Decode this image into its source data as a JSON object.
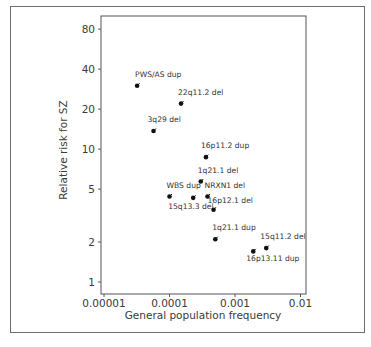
{
  "chart_data": {
    "type": "scatter",
    "title": "",
    "xlabel": "General population frequency",
    "ylabel": "Relative risk for SZ",
    "x_scale": "log",
    "y_scale": "log",
    "xlim": [
      1e-05,
      0.01
    ],
    "ylim": [
      0.9,
      100
    ],
    "x_ticks": [
      {
        "value": 1e-05,
        "label": "0.00001"
      },
      {
        "value": 0.0001,
        "label": "0.0001"
      },
      {
        "value": 0.001,
        "label": "0.001"
      },
      {
        "value": 0.01,
        "label": "0.01"
      }
    ],
    "y_ticks": [
      {
        "value": 1,
        "label": "1"
      },
      {
        "value": 2,
        "label": "2"
      },
      {
        "value": 5,
        "label": "5"
      },
      {
        "value": 10,
        "label": "10"
      },
      {
        "value": 20,
        "label": "20"
      },
      {
        "value": 40,
        "label": "40"
      },
      {
        "value": 80,
        "label": "80"
      }
    ],
    "grid": false,
    "legend": null,
    "points": [
      {
        "label": "PWS/AS dup",
        "x": 3.2e-05,
        "y": 30,
        "label_dx": -2,
        "label_dy": -9
      },
      {
        "label": "22q11.2 del",
        "x": 0.00015,
        "y": 22,
        "label_dx": -3,
        "label_dy": -9
      },
      {
        "label": "3q29 del",
        "x": 5.7e-05,
        "y": 13.7,
        "label_dx": -6,
        "label_dy": -9
      },
      {
        "label": "16p11.2 dup",
        "x": 0.00036,
        "y": 8.7,
        "label_dx": -5,
        "label_dy": -9
      },
      {
        "label": "1q21.1 del",
        "x": 0.0003,
        "y": 5.7,
        "label_dx": -3,
        "label_dy": -9
      },
      {
        "label": "WBS dup",
        "x": 0.0001,
        "y": 4.4,
        "label_dx": -3,
        "label_dy": -8
      },
      {
        "label": "15q13.3 del",
        "x": 0.00023,
        "y": 4.3,
        "label_dx": -25,
        "label_dy": 11
      },
      {
        "label": "NRXN1 del",
        "x": 0.00038,
        "y": 4.4,
        "label_dx": -3,
        "label_dy": -8
      },
      {
        "label": "16p12.1 del",
        "x": 0.00047,
        "y": 3.5,
        "label_dx": -6,
        "label_dy": -7
      },
      {
        "label": "1q21.1 dup",
        "x": 0.0005,
        "y": 2.1,
        "label_dx": -3,
        "label_dy": -9
      },
      {
        "label": "16p13.11 dup",
        "x": 0.0019,
        "y": 1.7,
        "label_dx": -7,
        "label_dy": 10
      },
      {
        "label": "15q11.2 del",
        "x": 0.003,
        "y": 1.8,
        "label_dx": -6,
        "label_dy": -9
      }
    ]
  },
  "colors": {
    "frame": "#6e6e6e",
    "axis": "#555555",
    "point": "#111111",
    "text": "#3a3a3a"
  }
}
